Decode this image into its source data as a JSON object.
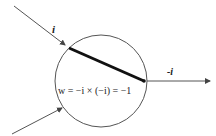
{
  "diagram": {
    "title": "",
    "input_label_top": "i",
    "output_label": "-i",
    "formula": "w = −i × (−i) = −1",
    "colors": {
      "line": "#555555",
      "weight_line": "#111111",
      "text": "#222222"
    }
  }
}
